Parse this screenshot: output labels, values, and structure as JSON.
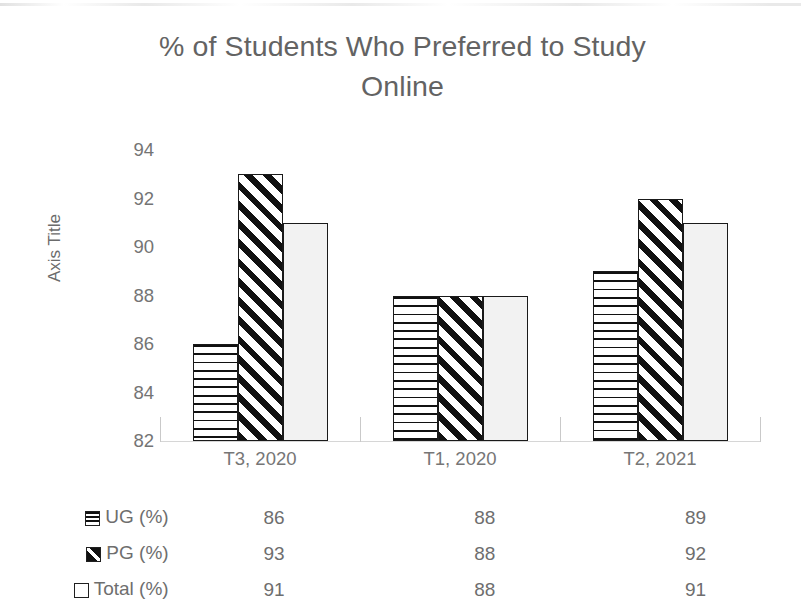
{
  "chart_data": {
    "type": "bar",
    "title": "% of Students Who  Preferred to Study Online",
    "title_line1": "% of Students Who  Preferred to Study",
    "title_line2": "Online",
    "xlabel": "",
    "ylabel": "Axis Title",
    "ylim": [
      82,
      94
    ],
    "ytick_step": 2,
    "yticks": [
      94,
      92,
      90,
      88,
      86,
      84,
      82
    ],
    "grid": false,
    "legend_position": "table-left",
    "categories": [
      "T3, 2020",
      "T1, 2020",
      "T2, 2021"
    ],
    "series": [
      {
        "name": "UG (%)",
        "values": [
          86,
          88,
          89
        ],
        "pattern": "horizontal",
        "swatch": "swatch-horizontal-icon"
      },
      {
        "name": "PG (%)",
        "values": [
          93,
          88,
          92
        ],
        "pattern": "diagonal",
        "swatch": "swatch-diagonal-icon"
      },
      {
        "name": "Total (%)",
        "values": [
          91,
          88,
          91
        ],
        "pattern": "solid",
        "swatch": "swatch-solid-icon"
      }
    ],
    "colors": {
      "title_text": "#636363",
      "tick_text": "#747474",
      "bar_outline": "#1a1a1a",
      "bar_pattern": "#111111",
      "bar_solid_fill": "#f2f2f2",
      "axis_line": "#d6d6d6",
      "background": "#ffffff"
    }
  },
  "axis": {
    "vertical_title": "Axis Title",
    "ticks": [
      "94",
      "92",
      "90",
      "88",
      "86",
      "84",
      "82"
    ]
  },
  "table": {
    "header": [
      "",
      "T3, 2020",
      "T1, 2020",
      "T2, 2021"
    ],
    "rows": [
      {
        "label": "UG (%)",
        "values": [
          "86",
          "88",
          "89"
        ]
      },
      {
        "label": "PG (%)",
        "values": [
          "93",
          "88",
          "92"
        ]
      },
      {
        "label": "Total (%)",
        "values": [
          "91",
          "88",
          "91"
        ]
      }
    ]
  }
}
